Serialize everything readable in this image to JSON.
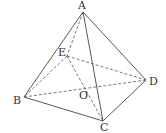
{
  "diagram": {
    "type": "pyramid",
    "points": {
      "A": {
        "label": "A",
        "x": 83,
        "y": 12,
        "lx": 78,
        "ly": 9
      },
      "B": {
        "label": "B",
        "x": 24,
        "y": 97,
        "lx": 13,
        "ly": 104
      },
      "C": {
        "label": "C",
        "x": 103,
        "y": 121,
        "lx": 100,
        "ly": 131
      },
      "D": {
        "label": "D",
        "x": 146,
        "y": 80,
        "lx": 149,
        "ly": 85
      },
      "E": {
        "label": "E",
        "x": 67,
        "y": 56,
        "lx": 58,
        "ly": 56
      },
      "O": {
        "label": "O",
        "x": 85,
        "y": 87,
        "lx": 79,
        "ly": 99
      }
    },
    "solid_edges": [
      "AB",
      "AC",
      "AD",
      "BC",
      "CD"
    ],
    "dashed_edges": [
      "AE",
      "EB",
      "ED",
      "EC",
      "BD"
    ],
    "colors": {
      "line": "#444444",
      "text": "#333333"
    }
  }
}
